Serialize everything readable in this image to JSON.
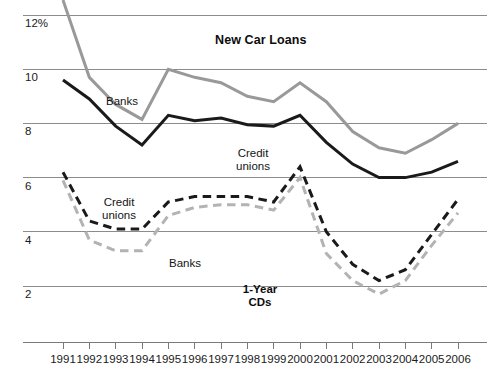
{
  "chart_data": {
    "type": "line",
    "title": "New Car Loans",
    "secondary_title": "1-Year CDs",
    "xlabel": "",
    "ylabel": "",
    "ylim": [
      1.0,
      12.6
    ],
    "xlim": [
      1991,
      2006
    ],
    "grid": true,
    "legend_position": "inline-annotations",
    "y_ticks": [
      "12%",
      "10",
      "8",
      "6",
      "4",
      "2"
    ],
    "y_tick_values": [
      12,
      10,
      8,
      6,
      4,
      2
    ],
    "x": [
      1991,
      1992,
      1993,
      1994,
      1995,
      1996,
      1997,
      1998,
      1999,
      2000,
      2001,
      2002,
      2003,
      2004,
      2005,
      2006
    ],
    "categories": [
      "1991",
      "1992",
      "1993",
      "1994",
      "1995",
      "1996",
      "1997",
      "1998",
      "1999",
      "2000",
      "2001",
      "2002",
      "2003",
      "2004",
      "2005",
      "2006"
    ],
    "series": [
      {
        "name": "New Car Loans - Banks",
        "group": "New Car Loans",
        "institution": "Banks",
        "color": "#999999",
        "style": "solid",
        "width": 3.0,
        "values": [
          12.55,
          9.7,
          8.7,
          8.15,
          10.0,
          9.7,
          9.5,
          9.0,
          8.8,
          9.5,
          8.8,
          7.7,
          7.1,
          6.9,
          7.4,
          8.0
        ]
      },
      {
        "name": "New Car Loans - Credit unions",
        "group": "New Car Loans",
        "institution": "Credit unions",
        "color": "#1a1a1a",
        "style": "solid",
        "width": 3.0,
        "values": [
          9.6,
          8.9,
          7.9,
          7.2,
          8.3,
          8.1,
          8.2,
          7.95,
          7.9,
          8.3,
          7.3,
          6.5,
          6.0,
          6.0,
          6.2,
          6.6
        ]
      },
      {
        "name": "1-Year CDs - Credit unions",
        "group": "1-Year CDs",
        "institution": "Credit unions",
        "color": "#1a1a1a",
        "style": "dashed",
        "width": 3.0,
        "values": [
          6.2,
          4.4,
          4.1,
          4.1,
          5.1,
          5.3,
          5.3,
          5.3,
          5.1,
          6.4,
          4.0,
          2.8,
          2.2,
          2.6,
          3.9,
          5.2
        ]
      },
      {
        "name": "1-Year CDs - Banks",
        "group": "1-Year CDs",
        "institution": "Banks",
        "color": "#b3b3b3",
        "style": "dashed",
        "width": 3.0,
        "values": [
          5.9,
          3.7,
          3.3,
          3.3,
          4.6,
          4.9,
          5.0,
          5.0,
          4.8,
          6.0,
          3.2,
          2.2,
          1.7,
          2.2,
          3.5,
          4.7
        ]
      }
    ],
    "annotations": [
      {
        "id": "banks-loans",
        "text": "Banks",
        "x_px": 122,
        "y_px": 95,
        "bold": false
      },
      {
        "id": "creditunions-loans",
        "text": "Credit\nunions",
        "x_px": 253,
        "y_px": 147,
        "bold": false
      },
      {
        "id": "creditunions-cds",
        "text": "Credit\nunions",
        "x_px": 119,
        "y_px": 196,
        "bold": false
      },
      {
        "id": "banks-cds",
        "text": "Banks",
        "x_px": 185,
        "y_px": 257,
        "bold": false
      },
      {
        "id": "cds-title",
        "text": "1-Year\nCDs",
        "x_px": 260,
        "y_px": 283,
        "bold": true
      }
    ],
    "colors": {
      "gray_line": "#999999",
      "gray_dashed": "#b3b3b3",
      "black_line": "#1a1a1a",
      "gridline": "#8c8c8c",
      "axis": "#7a7a7a",
      "text": "#161616",
      "background": "#ffffff"
    }
  }
}
